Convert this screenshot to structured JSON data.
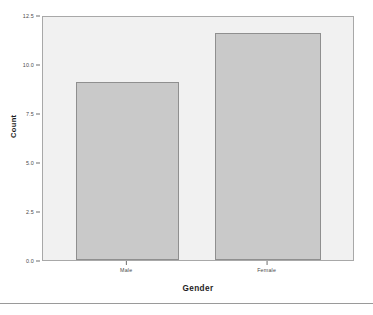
{
  "chart_data": {
    "type": "bar",
    "title": "",
    "categories": [
      "Male",
      "Female"
    ],
    "values": [
      11,
      14
    ],
    "xlabel": "Gender",
    "ylabel": "Count",
    "ylim": [
      0,
      15
    ],
    "yticks": [
      "0.0",
      "2.5",
      "5.0",
      "7.5",
      "10.0",
      "12.5"
    ],
    "ytick_values": [
      0,
      2.5,
      5,
      7.5,
      10,
      12.5
    ],
    "grid": false,
    "legend": "none",
    "bar_fill_color": "#c9c9c9",
    "bar_border_color": "#8f8f8f",
    "plot_background_color": "#f1f1f1",
    "plot_border_color": "#a8a8a8",
    "axis_text_color": "#4a4a4a",
    "title_text_color": "#1d1d1d"
  }
}
